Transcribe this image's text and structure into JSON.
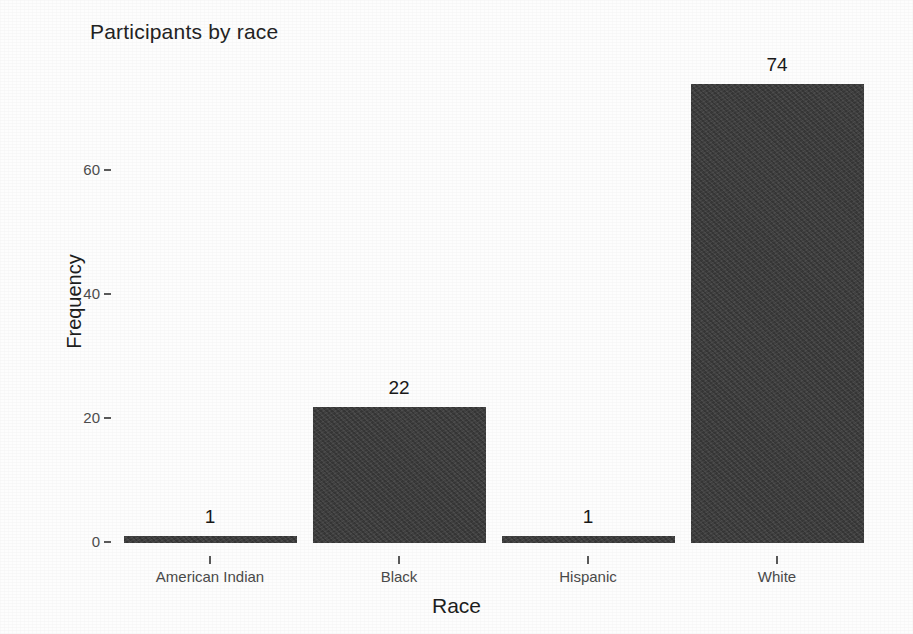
{
  "chart_data": {
    "type": "bar",
    "title": "Participants by race",
    "xlabel": "Race",
    "ylabel": "Frequency",
    "categories": [
      "American Indian",
      "Black",
      "Hispanic",
      "White"
    ],
    "values": [
      1,
      22,
      1,
      74
    ],
    "value_labels": [
      "1",
      "22",
      "1",
      "74"
    ],
    "ylim": [
      0,
      74
    ],
    "yticks": [
      0,
      20,
      40,
      60
    ],
    "ytick_labels": [
      "0",
      "20",
      "40",
      "60"
    ],
    "grid": false,
    "legend": null,
    "bar_color": "#3b3b3b",
    "background_color": "#fdfdfd",
    "text_color": "#1e1e1e"
  }
}
